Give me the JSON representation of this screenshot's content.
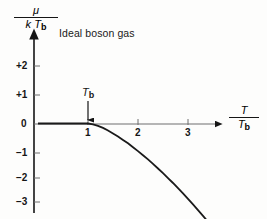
{
  "figure": {
    "title": "Ideal boson gas",
    "background_color": "#fdfdfc",
    "axis_color": "#151515",
    "curve_color": "#1a1a1a"
  },
  "yaxis": {
    "label_numerator": "μ",
    "label_denominator_k": "k",
    "label_denominator_T": "T",
    "label_denominator_sub": "b",
    "ticks": [
      "+2",
      "+1",
      "0",
      "−1",
      "−2",
      "−3"
    ],
    "tick_values": [
      2,
      1,
      0,
      -1,
      -2,
      -3
    ],
    "range": [
      -3.4,
      2.6
    ]
  },
  "xaxis": {
    "label_numerator": "T",
    "label_denominator_T": "T",
    "label_denominator_sub": "b",
    "ticks": [
      "1",
      "2",
      "3"
    ],
    "tick_values": [
      1,
      2,
      3
    ],
    "range": [
      0,
      3.6
    ]
  },
  "annotation": {
    "text_T": "T",
    "text_sub": "b",
    "at_x": 1,
    "arrow": "down-arrow-icon"
  },
  "chart_data": {
    "type": "line",
    "title": "Ideal boson gas",
    "xlabel": "T / T_b",
    "ylabel": "μ / (k T_b)",
    "xlim": [
      0,
      3.6
    ],
    "ylim": [
      -3.4,
      2.6
    ],
    "grid": false,
    "legend": null,
    "xticks": [
      1,
      2,
      3
    ],
    "yticks": [
      2,
      1,
      0,
      -1,
      -2,
      -3
    ],
    "annotations": [
      {
        "text": "T_b",
        "x": 1,
        "y": 0,
        "arrow": "down"
      }
    ],
    "series": [
      {
        "name": "chemical potential of ideal boson gas",
        "x": [
          0.0,
          0.2,
          0.4,
          0.6,
          0.8,
          1.0,
          1.1,
          1.2,
          1.3,
          1.4,
          1.5,
          1.6,
          1.7,
          1.8,
          1.9,
          2.0,
          2.1,
          2.2,
          2.3,
          2.4,
          2.5,
          2.6,
          2.7,
          2.8,
          2.9,
          3.0,
          3.1,
          3.2,
          3.3,
          3.4
        ],
        "y": [
          0.0,
          0.0,
          0.0,
          0.0,
          0.0,
          0.0,
          -0.03,
          -0.09,
          -0.17,
          -0.27,
          -0.38,
          -0.5,
          -0.63,
          -0.76,
          -0.91,
          -1.06,
          -1.22,
          -1.38,
          -1.55,
          -1.73,
          -1.91,
          -2.1,
          -2.29,
          -2.49,
          -2.69,
          -2.9,
          -3.11,
          -3.33,
          -3.55,
          -3.78
        ]
      }
    ]
  }
}
